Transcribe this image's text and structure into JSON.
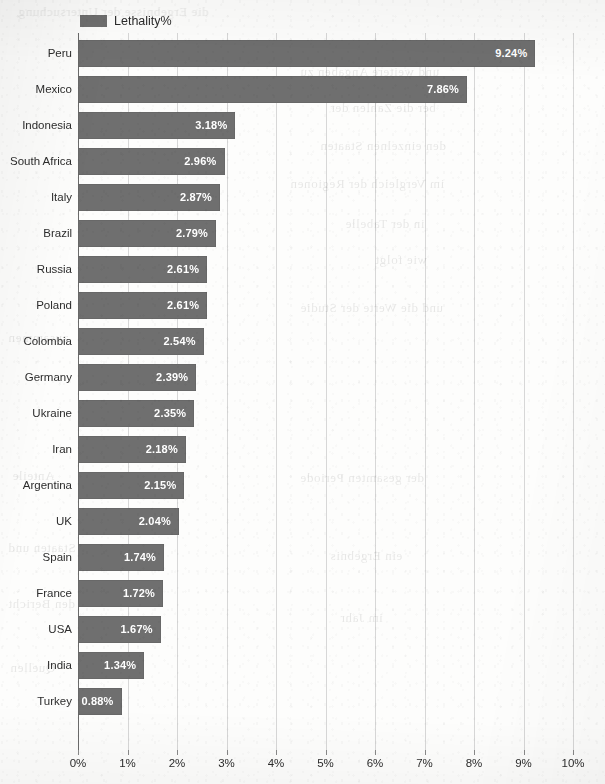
{
  "chart_data": {
    "type": "bar",
    "orientation": "horizontal",
    "title": "",
    "subtitle": "",
    "xlabel": "",
    "ylabel": "",
    "xlim": [
      0,
      10
    ],
    "xtick_labels": [
      "0%",
      "1%",
      "2%",
      "3%",
      "4%",
      "5%",
      "6%",
      "7%",
      "8%",
      "9%",
      "10%"
    ],
    "xtick_values": [
      0,
      1,
      2,
      3,
      4,
      5,
      6,
      7,
      8,
      9,
      10
    ],
    "grid": "vertical",
    "legend": {
      "position": "top-left",
      "entries": [
        {
          "name": "Lethality%",
          "color": "#6f6f6f"
        }
      ]
    },
    "series": [
      {
        "name": "Lethality%",
        "color": "#6f6f6f",
        "values": [
          9.24,
          7.86,
          3.18,
          2.96,
          2.87,
          2.79,
          2.61,
          2.61,
          2.54,
          2.39,
          2.35,
          2.18,
          2.15,
          2.04,
          1.74,
          1.72,
          1.67,
          1.34,
          0.88
        ]
      }
    ],
    "categories": [
      "Peru",
      "Mexico",
      "Indonesia",
      "South Africa",
      "Italy",
      "Brazil",
      "Russia",
      "Poland",
      "Colombia",
      "Germany",
      "Ukraine",
      "Iran",
      "Argentina",
      "UK",
      "Spain",
      "France",
      "USA",
      "India",
      "Turkey"
    ],
    "data_labels": [
      "9.24%",
      "7.86%",
      "3.18%",
      "2.96%",
      "2.87%",
      "2.79%",
      "2.61%",
      "2.61%",
      "2.54%",
      "2.39%",
      "2.35%",
      "2.18%",
      "2.15%",
      "2.04%",
      "1.74%",
      "1.72%",
      "1.67%",
      "1.34%",
      "0.88%"
    ],
    "bars": [
      {
        "category": "Peru",
        "value": 9.24,
        "label": "9.24%"
      },
      {
        "category": "Mexico",
        "value": 7.86,
        "label": "7.86%"
      },
      {
        "category": "Indonesia",
        "value": 3.18,
        "label": "3.18%"
      },
      {
        "category": "South Africa",
        "value": 2.96,
        "label": "2.96%"
      },
      {
        "category": "Italy",
        "value": 2.87,
        "label": "2.87%"
      },
      {
        "category": "Brazil",
        "value": 2.79,
        "label": "2.79%"
      },
      {
        "category": "Russia",
        "value": 2.61,
        "label": "2.61%"
      },
      {
        "category": "Poland",
        "value": 2.61,
        "label": "2.61%"
      },
      {
        "category": "Colombia",
        "value": 2.54,
        "label": "2.54%"
      },
      {
        "category": "Germany",
        "value": 2.39,
        "label": "2.39%"
      },
      {
        "category": "Ukraine",
        "value": 2.35,
        "label": "2.35%"
      },
      {
        "category": "Iran",
        "value": 2.18,
        "label": "2.18%"
      },
      {
        "category": "Argentina",
        "value": 2.15,
        "label": "2.15%"
      },
      {
        "category": "UK",
        "value": 2.04,
        "label": "2.04%"
      },
      {
        "category": "Spain",
        "value": 1.74,
        "label": "1.74%"
      },
      {
        "category": "France",
        "value": 1.72,
        "label": "1.72%"
      },
      {
        "category": "USA",
        "value": 1.67,
        "label": "1.67%"
      },
      {
        "category": "India",
        "value": 1.34,
        "label": "1.34%"
      },
      {
        "category": "Turkey",
        "value": 0.88,
        "label": "0.88%"
      }
    ]
  },
  "colors": {
    "bar": "#6f6f6f",
    "grid": "#d7d7d7",
    "axis": "#6b6b6b",
    "text": "#2d2d2d",
    "value_text": "#ffffff",
    "background": "#fdfdfc"
  }
}
